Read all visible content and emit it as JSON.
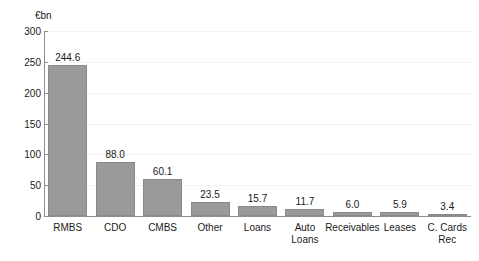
{
  "chart_data": {
    "type": "bar",
    "title": "",
    "subtitle": "",
    "unit_label": "€bn",
    "xlabel": "",
    "ylabel": "",
    "ylim": [
      0,
      300
    ],
    "ytick_step": 50,
    "yticks": [
      "0",
      "50",
      "100",
      "150",
      "200",
      "250",
      "300"
    ],
    "grid": true,
    "legend": "none",
    "bar_color": "#9a9a9a",
    "bar_edge_color": "#8a8a8a",
    "axis_color": "#8e8e8e",
    "grid_color": "#f2f2f2",
    "text_color": "#1a1a1a",
    "background_color": "#ffffff",
    "categories": [
      "RMBS",
      "CDO",
      "CMBS",
      "Other",
      "Loans",
      "Auto\nLoans",
      "Receivables",
      "Leases",
      "C. Cards Rec"
    ],
    "values": [
      244.6,
      88.0,
      60.1,
      23.5,
      15.7,
      11.7,
      6.0,
      5.9,
      3.4
    ],
    "value_labels": [
      "244.6",
      "88.0",
      "60.1",
      "23.5",
      "15.7",
      "11.7",
      "6.0",
      "5.9",
      "3.4"
    ]
  }
}
